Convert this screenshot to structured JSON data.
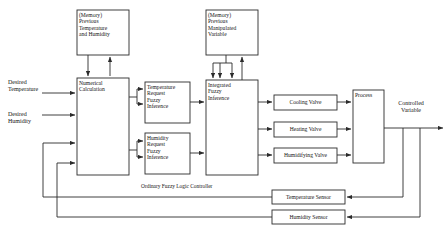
{
  "diagram": {
    "colors": {
      "stroke": "#2b2b2b",
      "box_fill": "#ffffff",
      "background": "#ffffff",
      "text": "#151515"
    },
    "blocks": [
      {
        "id": "memory-previous-temp-humidity",
        "label": "(Memory)\nPrevious\nTemperature\nand Humidity",
        "x": 77,
        "y": 10,
        "w": 52,
        "h": 45
      },
      {
        "id": "memory-previous-manipulated-variable",
        "label": "(Memory)\nPrevious\nManipulated\nVariable",
        "x": 206,
        "y": 10,
        "w": 52,
        "h": 45
      },
      {
        "id": "numerical-calculation",
        "label": "Numerical\nCalculation",
        "x": 77,
        "y": 78,
        "w": 52,
        "h": 97
      },
      {
        "id": "temperature-request-fuzzy-inference",
        "label": "Temperature\nRequest\nFuzzy\nInference",
        "x": 145,
        "y": 82,
        "w": 45,
        "h": 41
      },
      {
        "id": "humidity-request-fuzzy-inference",
        "label": "Humidity\nRequest\nFuzzy\nInference",
        "x": 145,
        "y": 133,
        "w": 45,
        "h": 41
      },
      {
        "id": "integrated-fuzzy-inference",
        "label": "Integrated\nFuzzy\nInference",
        "x": 206,
        "y": 80,
        "w": 52,
        "h": 95
      },
      {
        "id": "cooling-valve",
        "label": "Cooling Valve",
        "x": 274,
        "y": 95,
        "w": 63,
        "h": 15
      },
      {
        "id": "heating-valve",
        "label": "Heating Valve",
        "x": 274,
        "y": 122,
        "w": 63,
        "h": 15
      },
      {
        "id": "humidifying-valve",
        "label": "Humidifying Valve",
        "x": 274,
        "y": 148,
        "w": 63,
        "h": 15
      },
      {
        "id": "process",
        "label": "Process",
        "x": 353,
        "y": 90,
        "w": 31,
        "h": 73
      },
      {
        "id": "temperature-sensor",
        "label": "Temperature Sensor",
        "x": 272,
        "y": 190,
        "w": 73,
        "h": 14
      },
      {
        "id": "humidity-sensor",
        "label": "Humidity Sensor",
        "x": 272,
        "y": 210,
        "w": 73,
        "h": 14
      }
    ],
    "free_labels": [
      {
        "id": "desired-temperature",
        "label": "Desired\nTemperature",
        "x": 8,
        "y": 79
      },
      {
        "id": "desired-humidity",
        "label": "Desired\nHumidity",
        "x": 8,
        "y": 111
      },
      {
        "id": "controlled-variable",
        "label": "Controlled\nVariable",
        "x": 390,
        "y": 100
      },
      {
        "id": "ordinary-fuzzy-logic-controller",
        "label": "Ordinary Fuzzy Logic Controller",
        "x": 141,
        "y": 183
      }
    ]
  }
}
